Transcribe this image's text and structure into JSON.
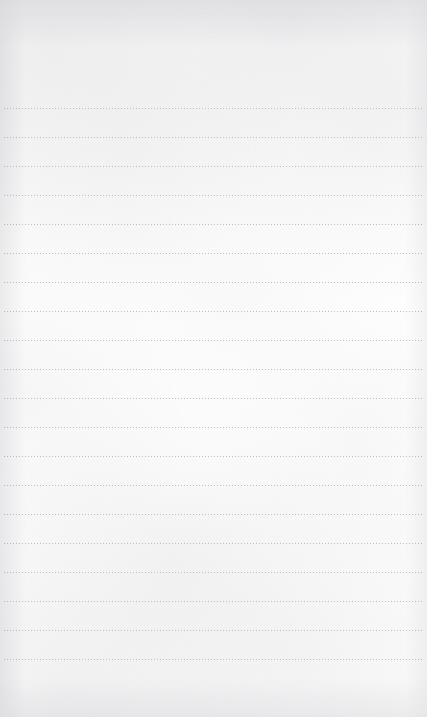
{
  "page": {
    "title": "Blank Lined Notepad",
    "kind": "lined-paper-sheet",
    "width": 427,
    "height": 717,
    "content_text": ""
  },
  "paper": {
    "background_color": "#fdfdfd",
    "texture": "subtle-fiber-mottle",
    "edge_shading_color": "#e4e4e7"
  },
  "ruling": {
    "style": "dotted",
    "line_color": "#b9b9bd",
    "dot_width_px": 1,
    "dot_gap_px": 2,
    "line_thickness_px": 1,
    "line_count": 20,
    "first_line_y": 108,
    "line_spacing_px": 29,
    "left_margin_px": 4,
    "right_margin_px": 4,
    "top_blank_area_px": 108,
    "bottom_blank_area_px": 44
  },
  "editor": {
    "placeholder": "",
    "value": "",
    "cursor_visible": false
  }
}
